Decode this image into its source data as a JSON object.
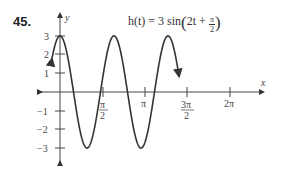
{
  "problem_number": "45.",
  "equation": {
    "lhs": "h(t) = 3 sin",
    "inner_pre": "2t + ",
    "frac_num": "π",
    "frac_den": "2"
  },
  "chart_data": {
    "type": "line",
    "xlabel": "x",
    "ylabel": "y",
    "x_ticks": [
      "π/2",
      "π",
      "3π/2",
      "2π"
    ],
    "y_ticks": [
      3,
      2,
      1,
      -1,
      -2,
      -3
    ],
    "xlim": [
      -0.45,
      7.0
    ],
    "ylim": [
      -3.6,
      3.6
    ],
    "grid": false,
    "series": [
      {
        "name": "h(t)",
        "function": "3*sin(2t + pi/2)",
        "domain": [
          -0.5,
          6.9
        ],
        "x": [
          0,
          0.785,
          1.571,
          2.356,
          3.142,
          3.927,
          4.712,
          5.498,
          6.283
        ],
        "values": [
          3,
          0,
          -3,
          0,
          3,
          0,
          -3,
          0,
          3
        ]
      }
    ]
  },
  "axes": {
    "x_label": "x",
    "y_label": "y",
    "x_tick_labels": {
      "pi_half_num": "π",
      "pi_half_den": "2",
      "pi": "π",
      "three_pi_half_num": "3π",
      "three_pi_half_den": "2",
      "two_pi": "2π"
    },
    "y_tick_labels": [
      "3",
      "2",
      "1",
      "−1",
      "−2",
      "−3"
    ]
  }
}
